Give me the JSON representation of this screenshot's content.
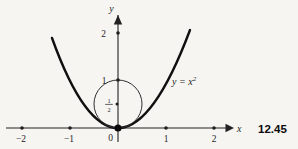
{
  "figure": {
    "number": "12.45",
    "colors": {
      "paper": "#f6f5f2",
      "ink": "#222222",
      "curve": "#101010"
    },
    "axes": {
      "x_label": "x",
      "y_label": "y",
      "origin_label": "0"
    },
    "x_tick_labels": [
      "−2",
      "−1",
      "1",
      "2"
    ],
    "y_tick_labels": [
      "2",
      "1"
    ],
    "half_fraction": {
      "numerator": "1",
      "denominator": "2"
    },
    "equation": {
      "base": "y = x",
      "exponent": "2"
    }
  }
}
